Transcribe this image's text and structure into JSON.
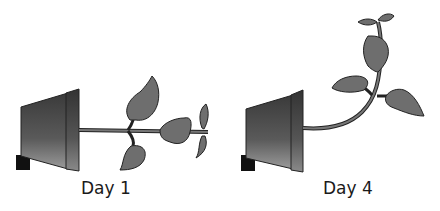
{
  "panels": [
    {
      "label": "Day 1",
      "description": "Pot tipped on its side; stem grows horizontally"
    },
    {
      "label": "Day 4",
      "description": "Pot tipped on its side; stem curves upward"
    }
  ],
  "colors": {
    "leaf": "#6e6e6e",
    "outline": "#222222",
    "pot_dark": "#1e1e1e",
    "pot_light": "#8a8a8a",
    "block": "#111111"
  }
}
